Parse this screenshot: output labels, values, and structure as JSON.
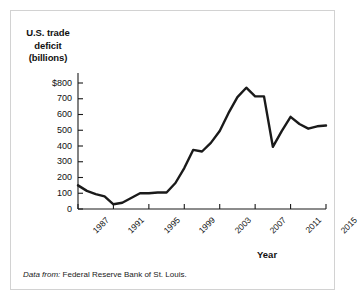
{
  "figure": {
    "source_lead": "Data from:",
    "source_text": "Federal Reserve Bank of St. Louis.",
    "frame_color": "#d2d2d2",
    "line_color": "#1a1a1a",
    "background": "#ffffff"
  },
  "chart_data": {
    "type": "line",
    "title": "",
    "ylabel": "U.S. trade deficit (billions)",
    "ylabel_lines": [
      "U.S. trade",
      "deficit",
      "(billions)"
    ],
    "xlabel": "Year",
    "xlim": [
      1987,
      2015
    ],
    "ylim": [
      0,
      800
    ],
    "grid": false,
    "legend": null,
    "ytick_labels": [
      "$800",
      "700",
      "600",
      "500",
      "400",
      "300",
      "200",
      "100",
      "0"
    ],
    "ytick_values": [
      800,
      700,
      600,
      500,
      400,
      300,
      200,
      100,
      0
    ],
    "xtick_labels": [
      "1987",
      "1991",
      "1995",
      "1999",
      "2003",
      "2007",
      "2011",
      "2015"
    ],
    "xtick_values": [
      1987,
      1991,
      1995,
      1999,
      2003,
      2007,
      2011,
      2015
    ],
    "x": [
      1987,
      1988,
      1989,
      1990,
      1991,
      1992,
      1993,
      1994,
      1995,
      1996,
      1997,
      1998,
      1999,
      2000,
      2001,
      2002,
      2003,
      2004,
      2005,
      2006,
      2007,
      2008,
      2009,
      2010,
      2011,
      2012,
      2013,
      2014,
      2015
    ],
    "values": [
      150,
      115,
      95,
      80,
      30,
      40,
      70,
      100,
      100,
      105,
      105,
      165,
      260,
      375,
      365,
      420,
      495,
      610,
      710,
      770,
      715,
      715,
      395,
      495,
      585,
      540,
      510,
      525,
      530
    ],
    "series": [
      {
        "name": "U.S. trade deficit (billions)",
        "values": [
          150,
          115,
          95,
          80,
          30,
          40,
          70,
          100,
          100,
          105,
          105,
          165,
          260,
          375,
          365,
          420,
          495,
          610,
          710,
          770,
          715,
          715,
          395,
          495,
          585,
          540,
          510,
          525,
          530
        ]
      }
    ]
  }
}
